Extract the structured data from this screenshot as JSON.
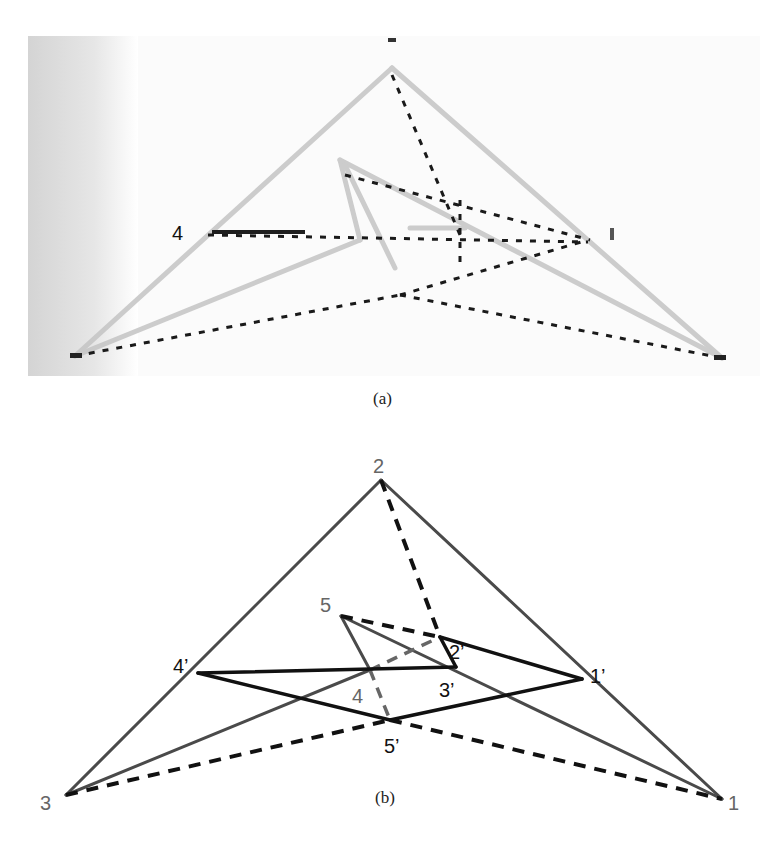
{
  "figure": {
    "panels": [
      {
        "id": "a",
        "caption": "(a)",
        "description": "Grayscale photograph of a hand-drawn/printed line figure: two triangle outlines (light gray) and dotted dark lines connecting vertices.",
        "labels": [
          "4"
        ]
      },
      {
        "id": "b",
        "caption": "(b)",
        "labels": {
          "v1": "1",
          "v2": "2",
          "v3": "3",
          "v4": "4",
          "v5": "5",
          "v1p": "1’",
          "v2p": "2’",
          "v3p": "3’",
          "v4p": "4’",
          "v5p": "5’"
        }
      }
    ]
  },
  "diagram_b": {
    "nodes": {
      "1": [
        722,
        799
      ],
      "2": [
        381,
        480
      ],
      "3": [
        66,
        795
      ],
      "4": [
        370,
        670
      ],
      "5": [
        341,
        616
      ],
      "1p": [
        582,
        679
      ],
      "2p": [
        440,
        637
      ],
      "3p": [
        456,
        667
      ],
      "4p": [
        198,
        673
      ],
      "5p": [
        390,
        720
      ]
    },
    "solid_gray_edges": [
      [
        "3",
        "2"
      ],
      [
        "2",
        "1"
      ],
      [
        "3",
        "4"
      ],
      [
        "4",
        "5"
      ],
      [
        "5",
        "1"
      ]
    ],
    "solid_black_edges": [
      [
        "4p",
        "3p"
      ],
      [
        "3p",
        "2p"
      ],
      [
        "2p",
        "1p"
      ],
      [
        "1p",
        "5p"
      ],
      [
        "5p",
        "4p"
      ]
    ],
    "dashed_black_edges": [
      [
        "2",
        "2p"
      ],
      [
        "5",
        "2p"
      ],
      [
        "3",
        "5p"
      ],
      [
        "5p",
        "1"
      ]
    ],
    "dashed_gray_edges": [
      [
        "4",
        "2p"
      ],
      [
        "4",
        "5p"
      ]
    ]
  },
  "colors": {
    "gray_line": "#4a4a4a",
    "black_line": "#111111",
    "gray_label": "#666666",
    "photo_gray": "#c8c8c8",
    "photo_dot": "#1a1a1a"
  }
}
